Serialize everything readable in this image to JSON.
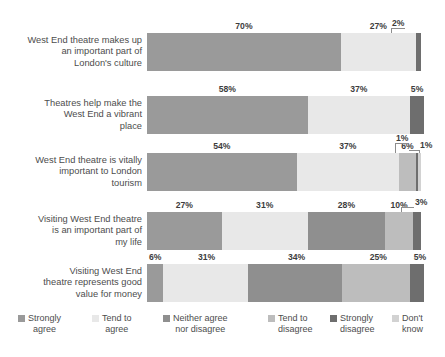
{
  "chart_data": {
    "type": "bar",
    "subtype": "horizontal-100-percent-stacked",
    "title": "",
    "xlabel": "",
    "ylabel": "",
    "xlim": [
      0,
      100
    ],
    "grid": false,
    "legend_position": "bottom",
    "value_suffix": "%",
    "categories": [
      "West End theatre makes up an important part of London's culture",
      "Theatres help make the West End a vibrant place",
      "West End theatre is vitally important to London tourism",
      "Visiting West End theatre is an important part of my life",
      "Visiting West End theatre represents good value for money"
    ],
    "series": [
      {
        "name": "Strongly agree",
        "color": "#9a9a9a",
        "values": [
          70,
          58,
          54,
          27,
          6
        ]
      },
      {
        "name": "Tend to agree",
        "color": "#e8e8e8",
        "values": [
          27,
          37,
          37,
          31,
          31
        ]
      },
      {
        "name": "Neither agree nor disagree",
        "color": "#8f8f8f",
        "values": [
          0,
          0,
          0,
          28,
          34
        ]
      },
      {
        "name": "Tend to disagree",
        "color": "#bdbdbd",
        "values": [
          0,
          0,
          6,
          10,
          25
        ]
      },
      {
        "name": "Strongly disagree",
        "color": "#6e6e6e",
        "values": [
          2,
          5,
          1,
          3,
          5
        ]
      },
      {
        "name": "Don't know",
        "color": "#d2d2d2",
        "values": [
          0,
          0,
          1,
          0,
          0
        ]
      }
    ]
  },
  "rows": [
    {
      "label_lines": [
        "West End theatre makes up",
        "an important part of",
        "London's culture"
      ],
      "segments": [
        {
          "series": 0,
          "value": 70,
          "text": "70%",
          "label_mode": "inline"
        },
        {
          "series": 1,
          "value": 27,
          "text": "27%",
          "label_mode": "inline"
        },
        {
          "series": 4,
          "value": 2,
          "text": "2%",
          "label_mode": "callout"
        }
      ]
    },
    {
      "label_lines": [
        "Theatres help make the",
        "West End a vibrant",
        "place"
      ],
      "segments": [
        {
          "series": 0,
          "value": 58,
          "text": "58%",
          "label_mode": "inline"
        },
        {
          "series": 1,
          "value": 37,
          "text": "37%",
          "label_mode": "inline"
        },
        {
          "series": 4,
          "value": 5,
          "text": "5%",
          "label_mode": "inline"
        }
      ]
    },
    {
      "label_lines": [
        "West End theatre is vitally",
        "important to London",
        "tourism"
      ],
      "segments": [
        {
          "series": 0,
          "value": 54,
          "text": "54%",
          "label_mode": "inline"
        },
        {
          "series": 1,
          "value": 37,
          "text": "37%",
          "label_mode": "inline"
        },
        {
          "series": 3,
          "value": 6,
          "text": "6%",
          "label_mode": "inline"
        },
        {
          "series": 4,
          "value": 1,
          "text": "1%",
          "label_mode": "callout"
        },
        {
          "series": 5,
          "value": 1,
          "text": "1%",
          "label_mode": "callout"
        }
      ]
    },
    {
      "label_lines": [
        "Visiting West End theatre",
        "is an important part of",
        "my life"
      ],
      "segments": [
        {
          "series": 0,
          "value": 27,
          "text": "27%",
          "label_mode": "inline"
        },
        {
          "series": 1,
          "value": 31,
          "text": "31%",
          "label_mode": "inline"
        },
        {
          "series": 2,
          "value": 28,
          "text": "28%",
          "label_mode": "inline"
        },
        {
          "series": 3,
          "value": 10,
          "text": "10%",
          "label_mode": "inline"
        },
        {
          "series": 4,
          "value": 3,
          "text": "3%",
          "label_mode": "callout"
        }
      ]
    },
    {
      "label_lines": [
        "Visiting West End",
        "theatre represents good",
        "value for money"
      ],
      "segments": [
        {
          "series": 0,
          "value": 6,
          "text": "6%",
          "label_mode": "inline"
        },
        {
          "series": 1,
          "value": 31,
          "text": "31%",
          "label_mode": "inline"
        },
        {
          "series": 2,
          "value": 34,
          "text": "34%",
          "label_mode": "inline"
        },
        {
          "series": 3,
          "value": 25,
          "text": "25%",
          "label_mode": "inline"
        },
        {
          "series": 4,
          "value": 5,
          "text": "5%",
          "label_mode": "inline"
        }
      ]
    }
  ],
  "legend": {
    "items": [
      {
        "line1": "Strongly",
        "line2": "agree",
        "color": "#9a9a9a"
      },
      {
        "line1": "Tend to",
        "line2": "agree",
        "color": "#e8e8e8"
      },
      {
        "line1": "Neither agree",
        "line2": "nor disagree",
        "color": "#8f8f8f"
      },
      {
        "line1": "Tend to",
        "line2": "disagree",
        "color": "#bdbdbd"
      },
      {
        "line1": "Strongly",
        "line2": "disagree",
        "color": "#6e6e6e"
      },
      {
        "line1": "Don't",
        "line2": "know",
        "color": "#d2d2d2"
      }
    ]
  }
}
